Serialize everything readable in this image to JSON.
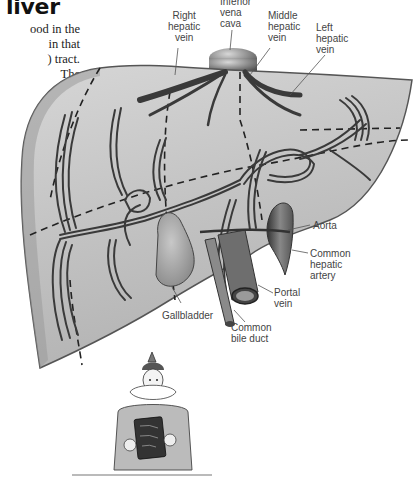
{
  "page": {
    "title": "liver",
    "intro_lines": [
      "ood in the",
      "in that",
      ") tract.",
      "The",
      "l",
      "y."
    ]
  },
  "diagram": {
    "subject": "liver",
    "labels": {
      "right_hepatic_vein": [
        "Right",
        "hepatic",
        "vein"
      ],
      "inferior_vena_cava": [
        "Inferior",
        "vena",
        "cava"
      ],
      "middle_hepatic_vein": [
        "Middle",
        "hepatic",
        "vein"
      ],
      "left_hepatic_vein": [
        "Left",
        "hepatic",
        "vein"
      ],
      "aorta": [
        "Aorta"
      ],
      "common_hepatic_artery": [
        "Common",
        "hepatic",
        "artery"
      ],
      "portal_vein": [
        "Portal",
        "vein"
      ],
      "gallbladder": [
        "Gallbladder"
      ],
      "common_bile_duct": [
        "Common",
        "bile duct"
      ]
    },
    "colors": {
      "liver_fill": "#c9c9c9",
      "liver_edge": "#8a8a8a",
      "vessel": "#3a3a3a",
      "label_text": "#444444",
      "leader_line": "#555555"
    }
  },
  "illustration": {
    "subject": "cartoon queen holding a book"
  }
}
